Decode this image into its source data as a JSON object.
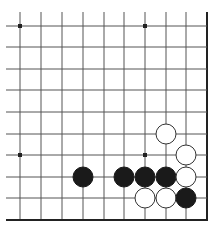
{
  "board": {
    "description": "Go board fragment (lower-right corner region)",
    "columns": 10,
    "rows": 10,
    "grid_x": [
      20,
      41,
      62,
      83,
      104,
      124,
      145,
      166,
      186,
      207
    ],
    "grid_y": [
      26,
      47,
      69,
      90,
      112,
      134,
      155,
      177,
      198,
      220
    ],
    "right_edge": true,
    "bottom_edge": true,
    "line_color": "#555555",
    "edge_color": "#222222",
    "star_points": [
      {
        "col": 0,
        "row": 0
      },
      {
        "col": 6,
        "row": 0
      },
      {
        "col": 0,
        "row": 6
      },
      {
        "col": 6,
        "row": 6
      }
    ],
    "stones": [
      {
        "color": "white",
        "col": 7,
        "row": 5
      },
      {
        "color": "white",
        "col": 8,
        "row": 6
      },
      {
        "color": "black",
        "col": 3,
        "row": 7
      },
      {
        "color": "black",
        "col": 5,
        "row": 7
      },
      {
        "color": "black",
        "col": 6,
        "row": 7
      },
      {
        "color": "black",
        "col": 7,
        "row": 7
      },
      {
        "color": "white",
        "col": 8,
        "row": 7
      },
      {
        "color": "white",
        "col": 6,
        "row": 8
      },
      {
        "color": "white",
        "col": 7,
        "row": 8
      },
      {
        "color": "black",
        "col": 8,
        "row": 8
      }
    ],
    "colors": {
      "black_stone": "#1a1a1a",
      "white_stone": "#ffffff",
      "white_stone_outline": "#333333"
    }
  }
}
